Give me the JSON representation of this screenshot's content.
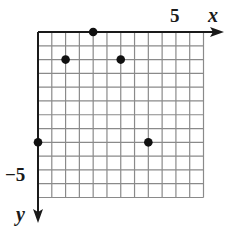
{
  "chart_data": {
    "type": "scatter",
    "title": "",
    "xlabel": "x",
    "ylabel": "y",
    "x_axis_direction": "right",
    "y_axis_direction": "down",
    "grid": true,
    "grid_step": 0.5,
    "xlim": [
      0,
      6
    ],
    "ylim": [
      -6,
      0
    ],
    "tick_labels": [
      {
        "axis": "x",
        "value": 5,
        "text": "5"
      },
      {
        "axis": "y",
        "value": -5,
        "text": "−5"
      }
    ],
    "points": [
      {
        "x": 2,
        "y": 0
      },
      {
        "x": 1,
        "y": -1
      },
      {
        "x": 3,
        "y": -1
      },
      {
        "x": 0,
        "y": -4
      },
      {
        "x": 4,
        "y": -4
      }
    ],
    "colors": {
      "grid": "#8a8a8a",
      "axis": "#1a1a1a",
      "point": "#111111"
    }
  },
  "labels": {
    "x_axis": "x",
    "y_axis": "y",
    "x_tick": "5",
    "y_tick": "−5"
  }
}
